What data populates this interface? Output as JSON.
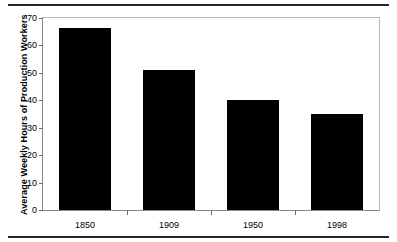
{
  "chart_data": {
    "type": "bar",
    "title": "",
    "xlabel": "",
    "ylabel": "Average Weekly Hours of Production Workers",
    "categories": [
      "1850",
      "1909",
      "1950",
      "1998"
    ],
    "values": [
      66.5,
      51.2,
      40.0,
      35.0
    ],
    "series": [
      {
        "name": "Average Weekly Hours",
        "values": [
          66.5,
          51.2,
          40.0,
          35.0
        ]
      }
    ],
    "ylim": [
      0,
      70
    ],
    "yticks": [
      0,
      10,
      20,
      30,
      40,
      50,
      60,
      70
    ],
    "ytick_labels": [
      "0",
      "10",
      "20",
      "30",
      "40",
      "50",
      "60",
      "70"
    ],
    "grid": false,
    "legend": "none",
    "bar_color": "#000000",
    "frame_color": "#b7b7b7",
    "rule_color": "#262626"
  }
}
